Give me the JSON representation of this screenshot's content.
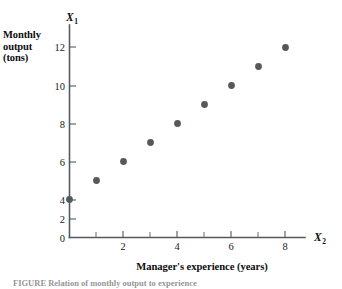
{
  "figure": {
    "y_axis_title_lines": [
      "Monthly",
      "output",
      "(tons)"
    ],
    "x_axis_title": "Manager's experience (years)",
    "y_axis_variable": "X",
    "y_axis_variable_subscript": "1",
    "x_axis_variable": "X",
    "x_axis_variable_subscript": "2",
    "origin_label": "0",
    "caption": "FIGURE  Relation of monthly output to experience",
    "dot_color": "#56585b",
    "axis_color": "#555a5e"
  },
  "chart_data": {
    "type": "scatter",
    "title": "",
    "subtitle": "",
    "xlabel": "Manager's experience (years)",
    "ylabel": "Monthly output (tons)",
    "x_variable": "X2",
    "y_variable": "X1",
    "xlim": [
      0,
      9
    ],
    "ylim": [
      0,
      13
    ],
    "x_ticks_major": [
      2,
      4,
      6,
      8
    ],
    "x_ticks_minor": [
      1,
      3,
      5,
      7
    ],
    "x_tick_labels": [
      "2",
      "4",
      "6",
      "8"
    ],
    "y_ticks_major": [
      2,
      4,
      6,
      8,
      10,
      12
    ],
    "y_tick_labels": [
      "2",
      "4",
      "6",
      "8",
      "10",
      "12"
    ],
    "grid": false,
    "legend": false,
    "legend_position": "none",
    "series": [
      {
        "name": "Monthly output vs experience",
        "marker": "filled-circle",
        "color": "#56585b",
        "points": [
          {
            "x": 0,
            "y": 2
          },
          {
            "x": 1,
            "y": 3
          },
          {
            "x": 2,
            "y": 4
          },
          {
            "x": 3,
            "y": 5
          },
          {
            "x": 4,
            "y": 6
          },
          {
            "x": 5,
            "y": 7
          },
          {
            "x": 6,
            "y": 8
          },
          {
            "x": 7,
            "y": 9
          },
          {
            "x": 8,
            "y": 10
          }
        ],
        "x": [
          0,
          1,
          2,
          3,
          4,
          5,
          6,
          7,
          8
        ],
        "values": [
          2,
          3,
          4,
          5,
          6,
          7,
          8,
          9,
          10
        ]
      }
    ],
    "annotations": []
  }
}
